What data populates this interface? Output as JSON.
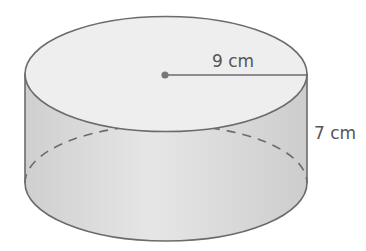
{
  "diagram": {
    "shape": "cylinder",
    "radius_label": "9 cm",
    "height_label": "7 cm",
    "colors": {
      "stroke": "#6b6b6b",
      "top_fill": "#ececec",
      "side_fill": "#d9d9d9",
      "text": "#555555"
    }
  }
}
